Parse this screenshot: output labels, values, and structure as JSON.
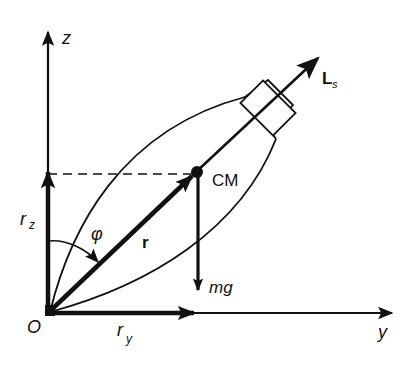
{
  "diagram": {
    "labels": {
      "z_axis": "z",
      "y_axis": "y",
      "origin": "O",
      "rz": "r",
      "rz_sub": "z",
      "ry": "r",
      "ry_sub": "y",
      "r": "r",
      "phi": "φ",
      "cm": "CM",
      "mg": "mg",
      "ls": "L",
      "ls_sub": "s"
    },
    "colors": {
      "ink": "#111111",
      "background": "#ffffff"
    }
  }
}
